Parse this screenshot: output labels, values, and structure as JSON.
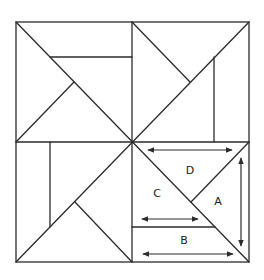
{
  "diagram": {
    "colors": {
      "line": "#2b2b2b",
      "background": "#ffffff"
    },
    "labels": {
      "a": "A",
      "b": "B",
      "c": "C",
      "d": "D"
    },
    "arrows": [
      {
        "name": "top-width-arrow",
        "orientation": "horizontal"
      },
      {
        "name": "c-base-arrow",
        "orientation": "horizontal"
      },
      {
        "name": "b-width-arrow",
        "orientation": "horizontal"
      },
      {
        "name": "a-height-arrow",
        "orientation": "vertical"
      }
    ]
  }
}
